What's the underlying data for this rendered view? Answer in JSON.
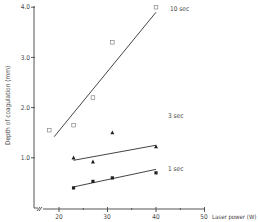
{
  "chart_data": {
    "type": "scatter",
    "title": "",
    "xlabel": "Laser power (W)",
    "ylabel": "Depth of coagulation (mm)",
    "xlim": [
      15,
      50
    ],
    "ylim": [
      0,
      4.0
    ],
    "x_ticks": [
      20,
      30,
      40,
      50
    ],
    "x_minor_ticks": [
      25,
      35,
      45
    ],
    "y_ticks": [
      1.0,
      2.0,
      3.0,
      4.0
    ],
    "y_tick_labels": [
      "1.0",
      "2.0",
      "3.0",
      "4.0"
    ],
    "grid": false,
    "axis_break": true,
    "series": [
      {
        "name": "10 sec",
        "marker": "open-square",
        "points": [
          {
            "x": 18,
            "y": 1.55
          },
          {
            "x": 23,
            "y": 1.65
          },
          {
            "x": 27,
            "y": 2.2
          },
          {
            "x": 31,
            "y": 3.3
          },
          {
            "x": 40,
            "y": 4.0
          }
        ],
        "fit_line": {
          "x0": 19,
          "y0": 1.42,
          "x1": 40,
          "y1": 3.9
        }
      },
      {
        "name": "3 sec",
        "marker": "filled-triangle",
        "points": [
          {
            "x": 23,
            "y": 1.0
          },
          {
            "x": 27,
            "y": 0.92
          },
          {
            "x": 31,
            "y": 1.5
          },
          {
            "x": 40,
            "y": 1.22
          }
        ],
        "fit_line": {
          "x0": 23,
          "y0": 0.95,
          "x1": 40,
          "y1": 1.25
        }
      },
      {
        "name": "1 sec",
        "marker": "filled-square",
        "points": [
          {
            "x": 23,
            "y": 0.4
          },
          {
            "x": 27,
            "y": 0.53
          },
          {
            "x": 31,
            "y": 0.6
          },
          {
            "x": 40,
            "y": 0.7
          }
        ],
        "fit_line": {
          "x0": 23,
          "y0": 0.42,
          "x1": 40,
          "y1": 0.77
        }
      }
    ],
    "annotations": [
      "10 sec",
      "3 sec",
      "1 sec"
    ]
  },
  "labels": {
    "y_axis": "Depth of coagulation (mm)",
    "x_axis": "Laser power (W)",
    "series_10": "10 sec",
    "series_3": "3 sec",
    "series_1": "1 sec",
    "ytick_4": "4.0",
    "ytick_3": "3.0",
    "ytick_2": "2.0",
    "ytick_1": "1.0",
    "xtick_20": "20",
    "xtick_30": "30",
    "xtick_40": "40",
    "xtick_50": "50"
  }
}
